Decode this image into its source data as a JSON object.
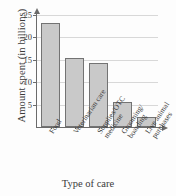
{
  "chart_data": {
    "type": "bar",
    "title": "",
    "categories": [
      "Food",
      "Veterinarian care",
      "Supplies/OTC medicine",
      "Grooming/boarding",
      "Live animal purchases"
    ],
    "category_lines": [
      [
        "Food",
        ""
      ],
      [
        "Veterinarian care",
        ""
      ],
      [
        "Supplies/OTC",
        "medicine"
      ],
      [
        "Grooming/",
        "boarding"
      ],
      [
        "Live animal",
        "purchases"
      ]
    ],
    "values": [
      23.2,
      15.4,
      14.3,
      5.5,
      2.2
    ],
    "xlabel": "Type of care",
    "ylabel": "Amount spent (in billions)",
    "ylim": [
      0,
      26.5
    ],
    "yticks": [
      5,
      10,
      15,
      20,
      25
    ],
    "ytick_labels": [
      "5",
      "10",
      "15",
      "20",
      "25"
    ],
    "grid": true,
    "legend": "none",
    "bar_fill": "#c9c9c9",
    "bar_stroke": "#737373",
    "axis_color": "#6b6b6b",
    "grid_color": "#d8d8d8",
    "background": "#fdfdfd"
  }
}
